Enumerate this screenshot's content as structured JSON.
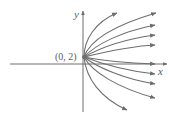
{
  "diagram": {
    "type": "family-of-curves",
    "axes": {
      "x_label": "x",
      "y_label": "y"
    },
    "point": {
      "label": "(0, 2)",
      "coords": [
        0,
        2
      ]
    },
    "curve_count": 10,
    "colors": {
      "curve": "#6e6e6e",
      "axis": "#6e6e6e",
      "label": "#5a5a5a",
      "background": "#ffffff"
    }
  }
}
